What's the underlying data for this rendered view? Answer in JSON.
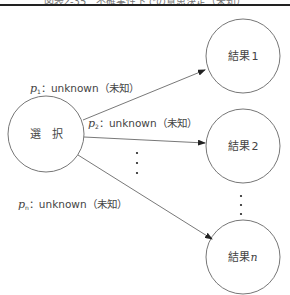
{
  "figure": {
    "caption": "図表2-35　不確実性下での意思決定（未知）"
  },
  "nodes": {
    "choice": {
      "label": "選　択"
    },
    "results": [
      {
        "label": "結果",
        "index": "1"
      },
      {
        "label": "結果",
        "index": "2"
      },
      {
        "label": "結果",
        "index": "n"
      }
    ]
  },
  "edges": [
    {
      "var": "p",
      "sub": "1",
      "text": "：unknown（未知）"
    },
    {
      "var": "p",
      "sub": "2",
      "text": "：unknown（未知）"
    },
    {
      "var": "p",
      "sub": "n",
      "text": "：unknown（未知）"
    }
  ],
  "ellipsis": "⋮",
  "colors": {
    "stroke": "#555555",
    "rule": "#222222",
    "text": "#444444"
  }
}
